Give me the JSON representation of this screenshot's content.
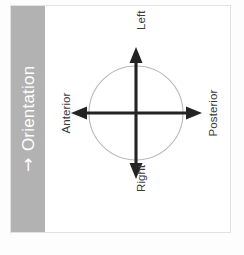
{
  "widget": {
    "title": "Orientation",
    "collapse_arrow_icon": "↑",
    "sidebar_color": "#b2b2b2",
    "sidebar_text_color": "#ffffff",
    "panel_background": "#ffffff",
    "panel_border_color": "#e2e2e2"
  },
  "diagram": {
    "type": "anatomical-orientation-compass",
    "ring_color": "#b9b9b9",
    "axis_color": "#232323",
    "label_color": "#3a3a3a",
    "axes": [
      {
        "id": "vertical",
        "positive_label": "Left",
        "negative_label": "Right"
      },
      {
        "id": "horizontal",
        "positive_label": "Posterior",
        "negative_label": "Anterior"
      }
    ],
    "labels": {
      "top": "Left",
      "bottom": "Right",
      "left": "Anterior",
      "right": "Posterior"
    }
  }
}
